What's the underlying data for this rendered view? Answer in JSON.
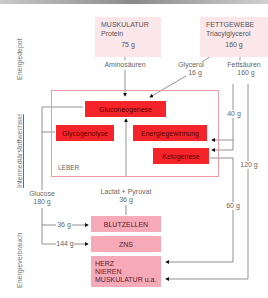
{
  "side_labels": {
    "depot": "Energiedepot",
    "intermediate": "Intermediärstoffwechsel",
    "consumption": "Energieverbrauch"
  },
  "depots": {
    "muscle": {
      "title": "MUSKULATUR",
      "substance": "Protein",
      "amount": "75 g"
    },
    "fat": {
      "title": "FETTGEWEBE",
      "substance": "Triacylglycerol",
      "amount": "160 g"
    }
  },
  "flows": {
    "amino": "Aminosäuren",
    "glycerol": "Glycerol",
    "glycerol_amount": "16 g",
    "fatty_acids": "Fettsäuren",
    "fatty_acids_amount": "160 g",
    "fa_40": "40 g",
    "fa_120": "120 g",
    "keto_60": "60 g",
    "glucose": "Glucose",
    "glucose_amount": "180 g",
    "lactate": "Lactat + Pyruvat",
    "lactate_amount": "36 g",
    "to_blood": "36 g",
    "to_cns": "144 g"
  },
  "liver": {
    "label": "LEBER",
    "processes": {
      "gluconeogenesis": "Gluconeogenese",
      "glycogenolysis": "Glycogenolyse",
      "energy": "Energiegewinnung",
      "ketogenesis": "Ketogenese"
    }
  },
  "consumers": {
    "blood": "BLUTZELLEN",
    "cns": "ZNS",
    "others": [
      "HERZ",
      "NIEREN",
      "MUSKULATUR u.a."
    ]
  },
  "colors": {
    "process_red": "#f5242a",
    "consumer_pink": "#f6a9b6",
    "depot_pink": "#fbe6ea",
    "liver_border": "#f19aa2"
  }
}
